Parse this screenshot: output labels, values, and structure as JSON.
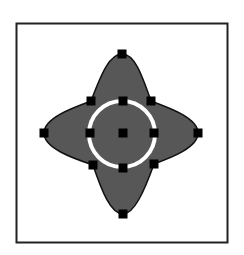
{
  "diagram": {
    "type": "vector-shape-with-control-points",
    "frame": {
      "x": 16,
      "y": 23,
      "width": 211,
      "height": 219,
      "stroke": "#222222"
    },
    "shape": {
      "description": "four-pointed star blob with inner circle",
      "fill": "#575757",
      "stroke": "#111111",
      "tips": {
        "top": [
          122,
          54
        ],
        "right": [
          198,
          133
        ],
        "bottom": [
          123,
          214
        ],
        "left": [
          44,
          133
        ]
      }
    },
    "inner_circle": {
      "cx": 122,
      "cy": 134,
      "r": 33,
      "fill": "#575757",
      "ring_color": "#ffffff",
      "ring_width": 4
    },
    "control_points": [
      {
        "name": "tip-top",
        "x": 122,
        "y": 54
      },
      {
        "name": "tip-right",
        "x": 198,
        "y": 133
      },
      {
        "name": "tip-bottom",
        "x": 123,
        "y": 214
      },
      {
        "name": "tip-left",
        "x": 44,
        "y": 133
      },
      {
        "name": "circle-top",
        "x": 123,
        "y": 101
      },
      {
        "name": "circle-right",
        "x": 154,
        "y": 133
      },
      {
        "name": "circle-bottom",
        "x": 123,
        "y": 168
      },
      {
        "name": "circle-left",
        "x": 90,
        "y": 133
      },
      {
        "name": "center",
        "x": 123,
        "y": 133
      },
      {
        "name": "junction-top-left",
        "x": 91,
        "y": 101
      },
      {
        "name": "junction-top-right",
        "x": 151,
        "y": 101
      },
      {
        "name": "junction-bottom-left",
        "x": 93,
        "y": 165
      },
      {
        "name": "junction-bottom-right",
        "x": 154,
        "y": 164
      }
    ],
    "handle_size": 9,
    "handle_color": "#000000"
  }
}
